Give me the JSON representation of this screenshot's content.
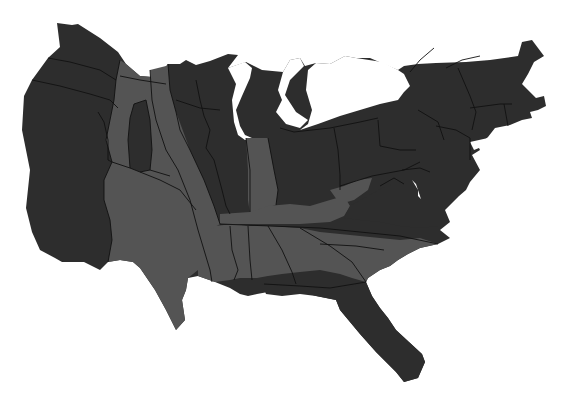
{
  "map": {
    "type": "cartogram",
    "region": "Contiguous United States",
    "colors": {
      "background": "#ffffff",
      "dark": "#2d2d2d",
      "mid": "#545454",
      "border": "#111111"
    },
    "legend": [],
    "title": "",
    "categories": [
      {
        "name": "dark",
        "regions": [
          "West Coast",
          "Northern Plains",
          "Upper Midwest",
          "Illinois",
          "Great Lakes",
          "Northeast",
          "Mid-Atlantic",
          "Virginia",
          "Florida panhandle & peninsula",
          "Colorado"
        ]
      },
      {
        "name": "mid",
        "regions": [
          "Mountain West",
          "Southern Plains",
          "Texas",
          "Indiana",
          "Kentucky",
          "Tennessee",
          "Deep South",
          "Carolinas",
          "West Virginia"
        ]
      }
    ]
  }
}
